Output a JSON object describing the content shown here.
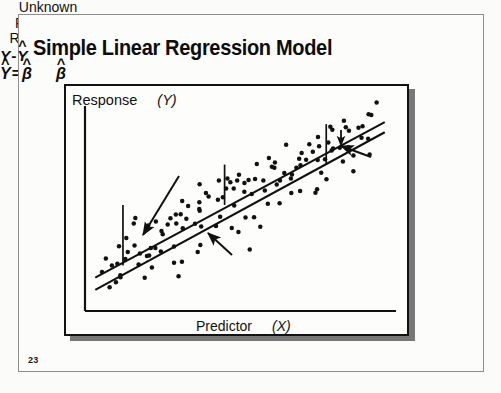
{
  "slide": {
    "title": "Simple Linear Regression Model",
    "number": "23",
    "axes": {
      "y_label": "Response",
      "y_var": "(Y)",
      "x_label": "Predictor",
      "x_var": "(X)"
    },
    "annotations": {
      "population_line": {
        "line1": "Unknown",
        "line2": "Population",
        "line3": "Relationship"
      },
      "residual": {
        "y": "Y",
        "minus": "-",
        "y_hat": "Y",
        "hat": "^"
      },
      "equation": {
        "y_hat": "Y",
        "equals": "=",
        "beta0": "β",
        "sub0": "0",
        "plus": "+",
        "beta1": "β",
        "sub1": "1",
        "x": "X",
        "hat": "^"
      }
    },
    "colors": {
      "ink": "#111111",
      "background": "#fcfcfb",
      "frame": "#8e8e90",
      "shadow": "#787878"
    }
  },
  "chart_data": {
    "type": "scatter",
    "title": "Simple Linear Regression Model",
    "xlabel": "Predictor (X)",
    "ylabel": "Response (Y)",
    "grid": false,
    "legend": null,
    "xlim": [
      0,
      100
    ],
    "ylim": [
      0,
      100
    ],
    "annotations": [
      "Unknown Population Relationship",
      "Y-Ŷ",
      "Ŷ = β̂0 + β̂1 X"
    ],
    "series": [
      {
        "name": "observations",
        "type": "scatter",
        "x": [
          8,
          10,
          9,
          12,
          7,
          14,
          11,
          16,
          13,
          18,
          15,
          20,
          17,
          22,
          19,
          24,
          21,
          26,
          23,
          28,
          25,
          30,
          27,
          32,
          29,
          34,
          31,
          36,
          33,
          38,
          35,
          40,
          37,
          42,
          39,
          44,
          41,
          46,
          43,
          48,
          45,
          50,
          47,
          52,
          49,
          54,
          51,
          56,
          53,
          58,
          55,
          60,
          57,
          62,
          59,
          64,
          61,
          66,
          63,
          68,
          65,
          70,
          67,
          72,
          69,
          74,
          71,
          76,
          73,
          78,
          75,
          80,
          77,
          82,
          79,
          84,
          81,
          86,
          83,
          88,
          85,
          90,
          87,
          92,
          89,
          94,
          6,
          11,
          16,
          21,
          26,
          31,
          36,
          41,
          46,
          51,
          56,
          61,
          66,
          71,
          76,
          81,
          86,
          91,
          13,
          23,
          33,
          43,
          53,
          63,
          73,
          83,
          93,
          18,
          38,
          58,
          78,
          88,
          28,
          48,
          68,
          8,
          30,
          52,
          74,
          90,
          35,
          55
        ],
        "y": [
          20,
          28,
          14,
          33,
          24,
          22,
          31,
          38,
          18,
          30,
          41,
          27,
          36,
          45,
          23,
          40,
          34,
          48,
          29,
          44,
          37,
          52,
          32,
          47,
          42,
          55,
          39,
          50,
          46,
          58,
          43,
          54,
          49,
          61,
          45,
          57,
          52,
          64,
          48,
          60,
          55,
          67,
          51,
          63,
          58,
          70,
          54,
          66,
          61,
          73,
          57,
          69,
          64,
          76,
          60,
          72,
          67,
          79,
          63,
          75,
          70,
          82,
          66,
          78,
          73,
          85,
          69,
          81,
          76,
          88,
          72,
          84,
          79,
          91,
          75,
          87,
          82,
          94,
          78,
          90,
          85,
          96,
          81,
          93,
          88,
          98,
          11,
          35,
          19,
          42,
          26,
          50,
          33,
          57,
          40,
          64,
          47,
          71,
          54,
          78,
          61,
          85,
          68,
          92,
          12,
          21,
          29,
          38,
          44,
          53,
          62,
          70,
          80,
          16,
          31,
          48,
          66,
          74,
          24,
          39,
          59,
          27,
          17,
          35,
          60,
          83,
          50,
          46
        ]
      }
    ],
    "lines": [
      {
        "name": "Unknown Population Relationship",
        "x": [
          3,
          97
        ],
        "y": [
          16,
          93
        ],
        "style": "solid"
      },
      {
        "name": "Fitted regression line",
        "x": [
          3,
          97
        ],
        "y": [
          10,
          88
        ],
        "style": "solid"
      }
    ],
    "residual_markers": [
      {
        "x": 12,
        "y0": 22,
        "y1": 52
      },
      {
        "x": 45,
        "y0": 52,
        "y1": 72
      },
      {
        "x": 78,
        "y0": 72,
        "y1": 92
      }
    ]
  }
}
